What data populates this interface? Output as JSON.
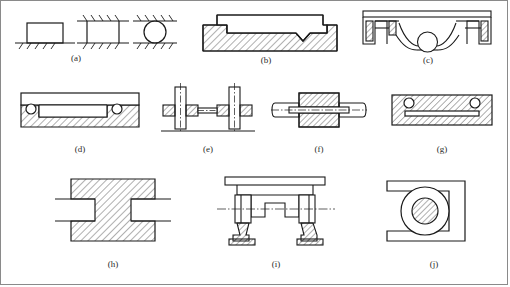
{
  "figure": {
    "background_color": "#ffffff",
    "line_color": "#1a1a1a",
    "hatch_color": "#1a1a1a",
    "border_color": "#8a8a8a",
    "panel_count": 10
  },
  "panels": [
    {
      "id": "a",
      "caption": "(a)",
      "description": "Three ground-supported elements on hatched ground lines: open rectangle, bracket between two hatched lines, and circle between two hatched lines",
      "shapes": [
        "rectangle-on-ground",
        "bracket-between-grounds",
        "circle-between-grounds"
      ],
      "hatched": false
    },
    {
      "id": "b",
      "caption": "(b)",
      "description": "Sectioned base block with hatching, flat cover plate on top and a V-notch groove at the right",
      "shapes": [
        "hatched-base",
        "cover-plate",
        "v-notch"
      ],
      "hatched": true
    },
    {
      "id": "c",
      "caption": "(c)",
      "description": "Housing with top plate, two narrow hatched vertical ribs and a ball resting in a curved seat",
      "shapes": [
        "top-plate",
        "hatched-ribs",
        "ball",
        "curved-seat"
      ],
      "hatched": true
    },
    {
      "id": "d",
      "caption": "(d)",
      "description": "Hatched base with stepped recess, cover plate and two small balls located at the corners",
      "shapes": [
        "hatched-base",
        "cover-plate",
        "ball-left",
        "ball-right"
      ],
      "hatched": true
    },
    {
      "id": "e",
      "caption": "(e)",
      "description": "Two vertical posts with centerlines, hatched collars on both sides and a connecting tie bar",
      "shapes": [
        "post-left",
        "post-right",
        "hatched-collars",
        "tie-bar",
        "ground-line"
      ],
      "hatched": true
    },
    {
      "id": "f",
      "caption": "(f)",
      "description": "Horizontal shaft passing through a hatched block, with horizontal dash-dot centerline",
      "shapes": [
        "shaft",
        "hatched-block",
        "centerline"
      ],
      "hatched": true
    },
    {
      "id": "g",
      "caption": "(g)",
      "description": "Fully hatched block containing an inner plate and two small circles near the top corners",
      "shapes": [
        "hatched-block",
        "inner-plate",
        "circle-left",
        "circle-right"
      ],
      "hatched": true
    },
    {
      "id": "h",
      "caption": "(h)",
      "description": "H-shaped hatched block with rectangular notches cut into the left and right sides",
      "shapes": [
        "hatched-block",
        "notch-left",
        "notch-right"
      ],
      "hatched": true
    },
    {
      "id": "i",
      "caption": "(i)",
      "description": "Symmetric frame assembly with top beam, stepped central member, dash-dot centerline and two hatched footed supports",
      "shapes": [
        "top-beam",
        "stepped-member",
        "centerline",
        "foot-left",
        "foot-right"
      ],
      "hatched": true
    },
    {
      "id": "j",
      "caption": "(j)",
      "description": "C-shaped bracket in section containing a large outer circle and a smaller hatched inner circle",
      "shapes": [
        "c-bracket",
        "outer-circle",
        "hatched-inner-circle"
      ],
      "hatched": true
    }
  ]
}
